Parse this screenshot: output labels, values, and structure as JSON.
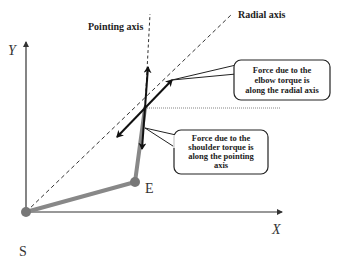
{
  "axes": {
    "y_label": "Y",
    "x_label": "X"
  },
  "points": {
    "shoulder": "S",
    "elbow": "E"
  },
  "lines": {
    "pointing_axis": "Pointing axis",
    "radial_axis": "Radial axis"
  },
  "callouts": {
    "elbow": [
      "Force due to the",
      "elbow torque is",
      "along the radial axis"
    ],
    "shoulder": [
      "Force due to the",
      "shoulder torque is",
      "along the pointing",
      "axis"
    ]
  },
  "colors": {
    "arm": "#888888",
    "joint": "#777777",
    "axis": "#333333",
    "arrow": "#111111"
  }
}
